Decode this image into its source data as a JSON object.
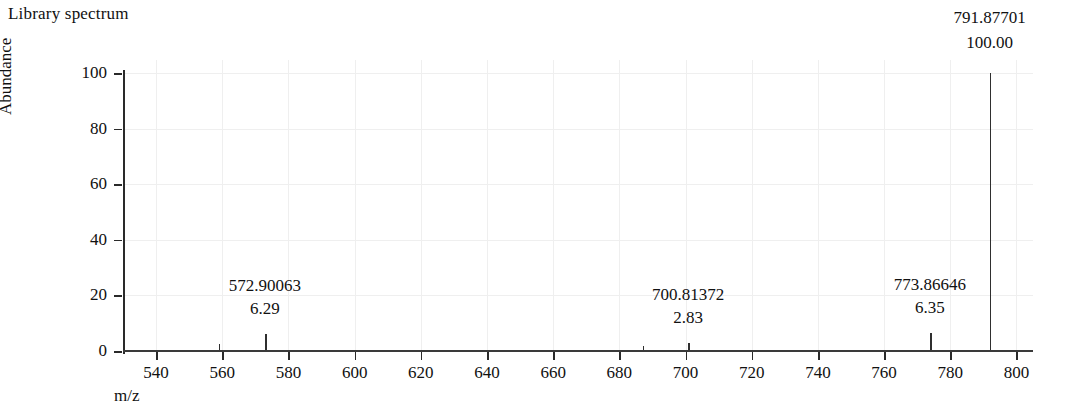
{
  "title": "Library spectrum",
  "axes": {
    "y_label": "Abundance",
    "x_label": "m/z",
    "y_ticks": [
      "0",
      "20",
      "40",
      "60",
      "80",
      "100"
    ],
    "x_ticks": [
      "540",
      "560",
      "580",
      "600",
      "620",
      "640",
      "660",
      "680",
      "700",
      "720",
      "740",
      "760",
      "780",
      "800"
    ]
  },
  "peaks": [
    {
      "mz": "572.90063",
      "intensity": "6.29"
    },
    {
      "mz": "700.81372",
      "intensity": "2.83"
    },
    {
      "mz": "773.86646",
      "intensity": "6.35"
    },
    {
      "mz": "791.87701",
      "intensity": "100.00"
    }
  ],
  "chart_data": {
    "type": "bar",
    "title": "Library spectrum",
    "xlabel": "m/z",
    "ylabel": "Abundance",
    "xlim": [
      530,
      805
    ],
    "ylim": [
      0,
      100
    ],
    "grid": true,
    "legend": null,
    "x_tick_values": [
      540,
      560,
      580,
      600,
      620,
      640,
      660,
      680,
      700,
      720,
      740,
      760,
      780,
      800
    ],
    "y_tick_values": [
      0,
      20,
      40,
      60,
      80,
      100
    ],
    "x": [
      558.9,
      572.90063,
      687.0,
      700.81372,
      773.86646,
      791.87701
    ],
    "values": [
      2.6,
      6.29,
      1.9,
      2.83,
      6.35,
      100.0
    ],
    "labels": [
      "",
      "572.90063",
      "",
      "700.81372",
      "773.86646",
      "791.87701"
    ],
    "data_labels": [
      "",
      "6.29",
      "",
      "2.83",
      "6.35",
      "100.00"
    ],
    "annotations": [
      {
        "mz": 572.90063,
        "intensity": 6.29,
        "label_mz": "572.90063",
        "label_intensity": "6.29"
      },
      {
        "mz": 700.81372,
        "intensity": 2.83,
        "label_mz": "700.81372",
        "label_intensity": "2.83"
      },
      {
        "mz": 773.86646,
        "intensity": 6.35,
        "label_mz": "773.86646",
        "label_intensity": "6.35"
      },
      {
        "mz": 791.87701,
        "intensity": 100.0,
        "label_mz": "791.87701",
        "label_intensity": "100.00"
      }
    ]
  }
}
